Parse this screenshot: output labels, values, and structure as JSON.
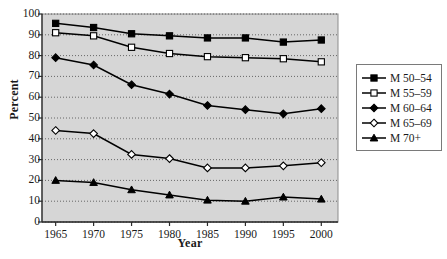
{
  "chart_data": {
    "type": "line",
    "title": "",
    "xlabel": "Year",
    "ylabel": "Percent",
    "x": [
      1965,
      1970,
      1975,
      1980,
      1985,
      1990,
      1995,
      2000
    ],
    "xtick_labels": [
      "1965",
      "1970",
      "1975",
      "1980",
      "1985",
      "1990",
      "1995",
      "2000"
    ],
    "ytick_labels": [
      "0",
      "10",
      "20",
      "30",
      "40",
      "50",
      "60",
      "70",
      "80",
      "90",
      "100"
    ],
    "ylim": [
      0,
      100
    ],
    "xlim": [
      1963.2,
      2002.2
    ],
    "grid": true,
    "grid_style": "dotted-horizontal",
    "legend_position": "right-outside",
    "plot_background": "#d6d6d6",
    "series": [
      {
        "name": "M 50-54",
        "label": "M 50–54",
        "marker": "filled-square",
        "color": "#000000",
        "values": [
          95.5,
          93.5,
          90.5,
          89.5,
          88.5,
          88.5,
          86.5,
          87.5
        ]
      },
      {
        "name": "M 55-59",
        "label": "M 55–59",
        "marker": "open-square",
        "color": "#000000",
        "values": [
          91.0,
          89.5,
          84.0,
          81.0,
          79.5,
          79.0,
          78.5,
          77.0
        ]
      },
      {
        "name": "M 60-64",
        "label": "M 60–64",
        "marker": "filled-diamond",
        "color": "#000000",
        "values": [
          79.0,
          75.5,
          66.0,
          61.5,
          56.0,
          54.0,
          52.0,
          54.5
        ]
      },
      {
        "name": "M 65-69",
        "label": "M 65–69",
        "marker": "open-diamond",
        "color": "#000000",
        "values": [
          44.0,
          42.5,
          32.5,
          30.5,
          26.0,
          26.0,
          27.0,
          28.5
        ]
      },
      {
        "name": "M 70+",
        "label": "M 70+",
        "marker": "filled-triangle",
        "color": "#000000",
        "values": [
          20.0,
          19.0,
          15.5,
          13.0,
          10.5,
          10.0,
          12.0,
          11.0
        ]
      }
    ]
  }
}
